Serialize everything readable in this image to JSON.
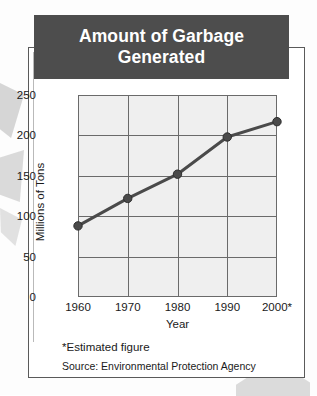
{
  "title": "Amount of Garbage Generated",
  "notes": {
    "estimated": "*Estimated figure",
    "source": "Source: Environmental Protection Agency"
  },
  "colors": {
    "banner_bg": "#4d4d4d",
    "banner_text": "#ffffff",
    "plot_bg": "#efefef",
    "grid": "#6a6a6a",
    "series": "#4a4a4a",
    "card_border": "#5a5a5a"
  },
  "chart_data": {
    "type": "line",
    "title": "Amount of Garbage Generated",
    "xlabel": "Year",
    "ylabel": "Millions of Tons",
    "categories": [
      "1960",
      "1970",
      "1980",
      "1990",
      "2000*"
    ],
    "x": [
      1960,
      1970,
      1980,
      1990,
      2000
    ],
    "values": [
      88,
      122,
      152,
      198,
      217
    ],
    "series": [
      {
        "name": "Garbage generated",
        "values": [
          88,
          122,
          152,
          198,
          217
        ]
      }
    ],
    "ylim": [
      0,
      250
    ],
    "yticks": [
      0,
      50,
      100,
      150,
      200,
      250
    ],
    "xticks": [
      "1960",
      "1970",
      "1980",
      "1990",
      "2000*"
    ],
    "grid": true,
    "legend": false,
    "markers": "filled-circle",
    "annotations": [
      "*Estimated figure",
      "Source: Environmental Protection Agency"
    ]
  }
}
